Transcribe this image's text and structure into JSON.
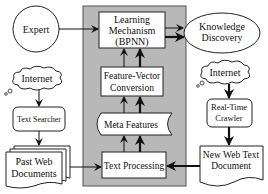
{
  "diagram": {
    "title_partial": "…gy…",
    "nodes": {
      "expert": {
        "label": "Expert",
        "shape": "circle"
      },
      "learning": {
        "lines": [
          "Learning",
          "Mechanism",
          "(BPNN)"
        ],
        "shape": "rect"
      },
      "knowledge": {
        "lines": [
          "Knowledge",
          "Discovery"
        ],
        "shape": "ellipse"
      },
      "internet_left": {
        "label": "Internet",
        "shape": "cloud"
      },
      "internet_right": {
        "label": "Internet",
        "shape": "cloud"
      },
      "feature_vector": {
        "lines": [
          "Feature-Vector",
          "Conversion"
        ],
        "shape": "rect"
      },
      "text_searcher": {
        "label": "Text Searcher",
        "shape": "rounded-rect"
      },
      "real_time_crawler": {
        "lines": [
          "Real-Time",
          "Crawler"
        ],
        "shape": "rounded-rect"
      },
      "meta_features": {
        "label": "Meta Features",
        "shape": "stored-data"
      },
      "past_web_docs": {
        "lines": [
          "Past Web",
          "Documents"
        ],
        "shape": "multi-document"
      },
      "text_processing": {
        "label": "Text Processing",
        "shape": "rect"
      },
      "new_web_doc": {
        "lines": [
          "New Web Text",
          "Document"
        ],
        "shape": "document"
      }
    },
    "colors": {
      "system_box": "#b8b8b8",
      "stroke": "#222222",
      "fill": "#ffffff"
    }
  }
}
